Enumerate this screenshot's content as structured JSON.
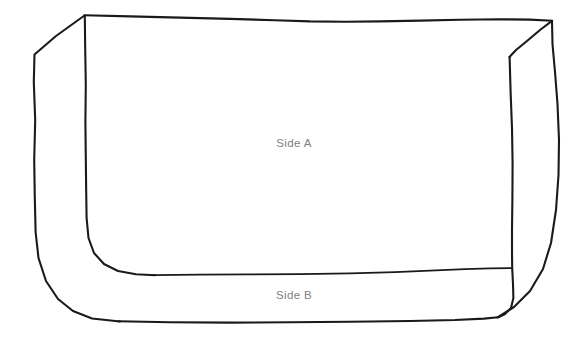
{
  "figure": {
    "background_color": "#ffffff",
    "stroke_color": "#1a1a1a",
    "label_color": "#808080"
  },
  "labels": [
    {
      "id": "side-a",
      "text": "Side A",
      "x": 294,
      "y": 143
    },
    {
      "id": "side-b",
      "text": "Side B",
      "x": 294,
      "y": 295
    }
  ],
  "shape_notes": {
    "type": "line-sketch",
    "panel_count": 2,
    "outline_style": "freehand"
  }
}
